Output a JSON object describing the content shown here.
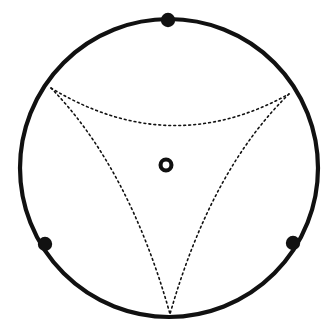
{
  "figure": {
    "title": "Disk with three boundary marked points and an inscribed dashed curvilinear triangle",
    "background_color": "#ffffff",
    "stroke_color": "#111111",
    "canvas": {
      "width": 334,
      "height": 333
    }
  },
  "chart_data": {
    "type": "diagram",
    "title": "Disk with three boundary marked points and an inscribed dashed curvilinear triangle",
    "xlabel": "",
    "ylabel": "",
    "grid": false,
    "legend": "none",
    "xlim": [
      0,
      334
    ],
    "ylim": [
      0,
      333
    ],
    "boundary_circle": {
      "name": "outer-circle",
      "center": [
        169,
        168
      ],
      "radius": 149,
      "stroke": "#111111",
      "stroke_width": 4.2,
      "style": "solid",
      "fill": "none"
    },
    "center_marker": {
      "name": "center-ring",
      "shape": "annulus",
      "center": [
        166,
        165
      ],
      "outer_radius": 7.5,
      "inner_radius": 3.4,
      "stroke": "#111111",
      "fill": "none"
    },
    "boundary_points": [
      {
        "label": "top-vertex",
        "position": [
          168,
          20
        ],
        "angle_deg": 90,
        "radius": 7.2,
        "fill": "#111111"
      },
      {
        "label": "lower-left-vertex",
        "position": [
          45,
          244
        ],
        "angle_deg": 210,
        "radius": 7.2,
        "fill": "#111111"
      },
      {
        "label": "lower-right-vertex",
        "position": [
          293,
          243
        ],
        "angle_deg": 330,
        "radius": 7.2,
        "fill": "#111111"
      }
    ],
    "triangle_vertices": [
      {
        "label": "upper-left-corner",
        "position": [
          51,
          88
        ],
        "angle_deg": 150
      },
      {
        "label": "upper-right-corner",
        "position": [
          289,
          94
        ],
        "angle_deg": 30
      },
      {
        "label": "bottom-corner",
        "position": [
          170,
          314
        ],
        "angle_deg": 270
      }
    ],
    "dashed_arcs": [
      {
        "name": "top-arc",
        "from": "upper-left-corner",
        "to": "upper-right-corner",
        "start": [
          51,
          88
        ],
        "end": [
          289,
          94
        ],
        "control": [
          170,
          160
        ],
        "sagitta_point": [
          170,
          126
        ],
        "style": "dotted",
        "stroke": "#111111",
        "stroke_width": 1.6,
        "dash_pattern": "1.8 3.2",
        "curvature": "bows toward disk center"
      },
      {
        "name": "left-arc",
        "from": "upper-left-corner",
        "to": "bottom-corner",
        "start": [
          51,
          88
        ],
        "end": [
          170,
          314
        ],
        "control": [
          129,
          168
        ],
        "sagitta_point": [
          120,
          192
        ],
        "style": "dotted",
        "stroke": "#111111",
        "stroke_width": 1.6,
        "dash_pattern": "1.8 3.2",
        "curvature": "bows toward disk center"
      },
      {
        "name": "right-arc",
        "from": "upper-right-corner",
        "to": "bottom-corner",
        "start": [
          289,
          94
        ],
        "end": [
          170,
          314
        ],
        "control": [
          211,
          170
        ],
        "sagitta_point": [
          220,
          195
        ],
        "style": "dotted",
        "stroke": "#111111",
        "stroke_width": 1.6,
        "dash_pattern": "1.8 3.2",
        "curvature": "bows toward disk center"
      }
    ]
  }
}
